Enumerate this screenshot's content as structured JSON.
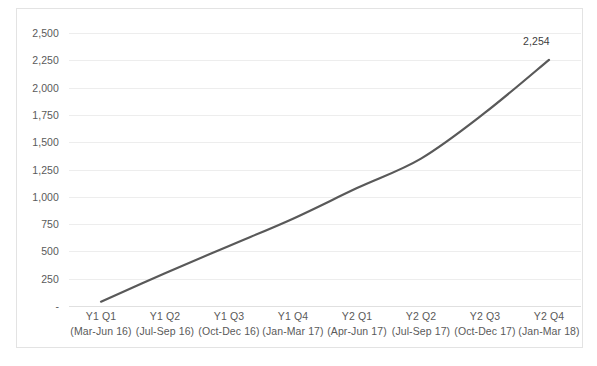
{
  "chart_data": {
    "type": "line",
    "title": "",
    "subtitle": "",
    "xlabel": "",
    "ylabel": "",
    "categories": [
      "Y1 Q1",
      "Y1 Q2",
      "Y1 Q3",
      "Y1 Q4",
      "Y2 Q1",
      "Y2 Q2",
      "Y2 Q3",
      "Y2 Q4"
    ],
    "category_sublabels": [
      "(Mar-Jun 16)",
      "(Jul-Sep 16)",
      "(Oct-Dec 16)",
      "(Jan-Mar 17)",
      "(Apr-Jun 17)",
      "(Jul-Sep 17)",
      "(Oct-Dec 17)",
      "(Jan-Mar 18)"
    ],
    "values": [
      40,
      300,
      550,
      800,
      1080,
      1350,
      1770,
      2254
    ],
    "ylim": [
      0,
      2500
    ],
    "ytick_values": [
      2500,
      2250,
      2000,
      1750,
      1500,
      1250,
      1000,
      750,
      500,
      250,
      0
    ],
    "ytick_labels": [
      "2,500",
      "2,250",
      "2,000",
      "1,750",
      "1,500",
      "1,250",
      "1,000",
      "750",
      "500",
      "250",
      "-"
    ],
    "grid": true,
    "legend": false,
    "legend_position": "none",
    "smoothed_line": true,
    "data_labels": [
      {
        "category": "Y2 Q4",
        "value": 2254,
        "text": "2,254"
      }
    ],
    "series": [
      {
        "name": "",
        "color": "#595959",
        "line_width": 2.2,
        "values": [
          40,
          300,
          550,
          800,
          1080,
          1350,
          1770,
          2254
        ]
      }
    ]
  },
  "style": {
    "plot_background": "#ffffff",
    "gridline_color": "#ededed",
    "axis_text_color": "#5a5a5a",
    "border_color": "#e3e3e3"
  }
}
